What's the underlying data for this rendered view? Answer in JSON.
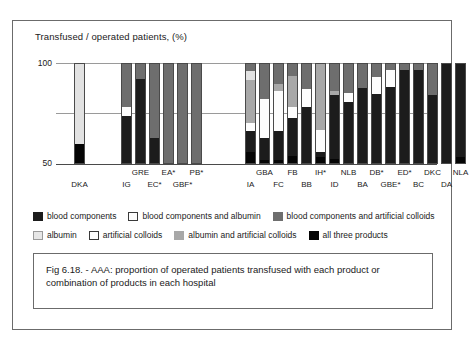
{
  "figure": {
    "caption": "Fig  6.18. - AAA: proportion of operated patients transfused with each product or combination of products in  each hospital"
  },
  "chart_data": {
    "type": "bar",
    "subtype": "stacked-bar-percent",
    "title": "Transfused / operated patients, (%)",
    "xlabel": "",
    "ylabel": "Transfused / operated patients, (%)",
    "ylim": [
      0,
      100
    ],
    "yticks": [
      50,
      100
    ],
    "ytick_labels": [
      "50",
      "100"
    ],
    "grid": true,
    "legend_position": "below-plot",
    "categories": [
      "DKA",
      "IG",
      "GRE",
      "EC*",
      "EA*",
      "GBF*",
      "PB*",
      "IA",
      "GBA",
      "FC",
      "FB",
      "BB",
      "IH*",
      "ID",
      "NLB",
      "BA",
      "DB*",
      "GBE*",
      "ED*",
      "BC",
      "DKC",
      "DA",
      "NLA"
    ],
    "category_label_rows": [
      "bottom",
      "bottom",
      "top",
      "bottom",
      "top",
      "bottom",
      "top",
      "bottom",
      "top",
      "bottom",
      "top",
      "bottom",
      "top",
      "bottom",
      "top",
      "bottom",
      "top",
      "bottom",
      "top",
      "bottom",
      "top",
      "bottom",
      "top"
    ],
    "series": [
      {
        "name": "blood components",
        "key": "blood",
        "color": "#1c1c1c",
        "values": [
          0,
          48,
          84,
          26,
          0,
          0,
          0,
          21,
          22,
          29,
          38,
          56,
          5,
          63,
          61,
          75,
          69,
          76,
          93,
          93,
          68,
          100,
          93
        ]
      },
      {
        "name": "blood components and albumin",
        "key": "blood_alb",
        "color": "#fdfdfd",
        "values": [
          0,
          8,
          0,
          0,
          0,
          0,
          0,
          8,
          38,
          39,
          10,
          18,
          22,
          0,
          9,
          0,
          17,
          17,
          0,
          0,
          0,
          0,
          0
        ]
      },
      {
        "name": "blood components and artificial colloids",
        "key": "blood_coll",
        "color": "#6e6e6e",
        "values": [
          0,
          44,
          16,
          74,
          100,
          100,
          100,
          8,
          36,
          21,
          13,
          26,
          0,
          28,
          30,
          25,
          14,
          7,
          7,
          7,
          32,
          0,
          0
        ]
      },
      {
        "name": "albumin",
        "key": "albumin",
        "color": "#e2e2e2",
        "values": [
          80,
          0,
          0,
          0,
          0,
          0,
          0,
          9,
          0,
          0,
          0,
          0,
          0,
          0,
          0,
          0,
          0,
          0,
          0,
          0,
          0,
          0,
          0
        ]
      },
      {
        "name": "artificial colloids",
        "key": "artcoll",
        "color": "#ffffff",
        "values": [
          0,
          0,
          0,
          0,
          0,
          0,
          0,
          0,
          0,
          0,
          0,
          0,
          0,
          0,
          0,
          0,
          0,
          0,
          0,
          0,
          0,
          0,
          0
        ]
      },
      {
        "name": "albumin and artificial colloids",
        "key": "alb_artcoll",
        "color": "#a8a8a8",
        "values": [
          0,
          0,
          0,
          0,
          0,
          0,
          0,
          42,
          0,
          7,
          31,
          0,
          66,
          4,
          0,
          0,
          0,
          0,
          0,
          0,
          0,
          0,
          0
        ]
      },
      {
        "name": "all  three products",
        "key": "all_three",
        "color": "#050505",
        "values": [
          20,
          0,
          0,
          0,
          0,
          0,
          0,
          12,
          4,
          4,
          8,
          0,
          7,
          5,
          0,
          0,
          0,
          0,
          0,
          0,
          0,
          0,
          7
        ]
      }
    ],
    "bar_layout": {
      "plot_width_px": 381,
      "bar_width_px": 11,
      "positions_px": [
        18,
        65,
        79,
        93,
        107,
        121,
        135,
        189,
        203,
        217,
        231,
        245,
        259,
        273,
        287,
        301,
        315,
        329,
        343,
        357,
        371,
        385,
        399
      ]
    }
  },
  "legend": {
    "rows": [
      [
        {
          "key": "blood",
          "label": "blood components"
        },
        {
          "key": "blood_alb",
          "label": "blood components and albumin"
        },
        {
          "key": "blood_coll",
          "label": "blood components and artificial colloids"
        }
      ],
      [
        {
          "key": "albumin",
          "label": "albumin"
        },
        {
          "key": "artcoll",
          "label": "artificial colloids"
        },
        {
          "key": "alb_artcoll",
          "label": "albumin and artificial colloids"
        },
        {
          "key": "all_three",
          "label": "all  three products"
        }
      ]
    ]
  }
}
